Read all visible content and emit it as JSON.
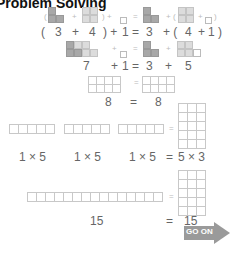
{
  "title": "Problem Solving",
  "rows": {
    "row1_symbols": {
      "open_paren": "(",
      "plus1": "+",
      "close_paren_plus": ") +",
      "eq": "=",
      "plus2": "+ (",
      "plus3": "+",
      "close": ")"
    },
    "row2": {
      "open": "(",
      "a": "3",
      "plus": "+",
      "b": "4",
      "close_plus": ") +",
      "c": "1",
      "eq": "=",
      "d": "3",
      "plus2": "+ (",
      "e": "4",
      "plus3": "+",
      "f": "1",
      "close": ")"
    },
    "row3_symbols": {
      "plus": "+",
      "eq": "=",
      "plus2": "+"
    },
    "row4": {
      "a": "7",
      "plus": "+",
      "b": "1",
      "eq": "=",
      "c": "3",
      "plus2": "+",
      "d": "5"
    },
    "row5_symbols": {
      "eq": "="
    },
    "row6": {
      "a": "8",
      "eq": "=",
      "b": "8"
    },
    "row7_symbols": {
      "eq": "="
    },
    "row8": {
      "a": "1 × 5",
      "b": "1 × 5",
      "c": "1 × 5",
      "eq": "=",
      "d": "5 × 3"
    },
    "row9_symbols": {
      "eq": "="
    },
    "row10": {
      "a": "15",
      "eq": "=",
      "b": "15"
    }
  },
  "go_on_button": {
    "label": "GO ON",
    "color": "#9a9a9a"
  }
}
